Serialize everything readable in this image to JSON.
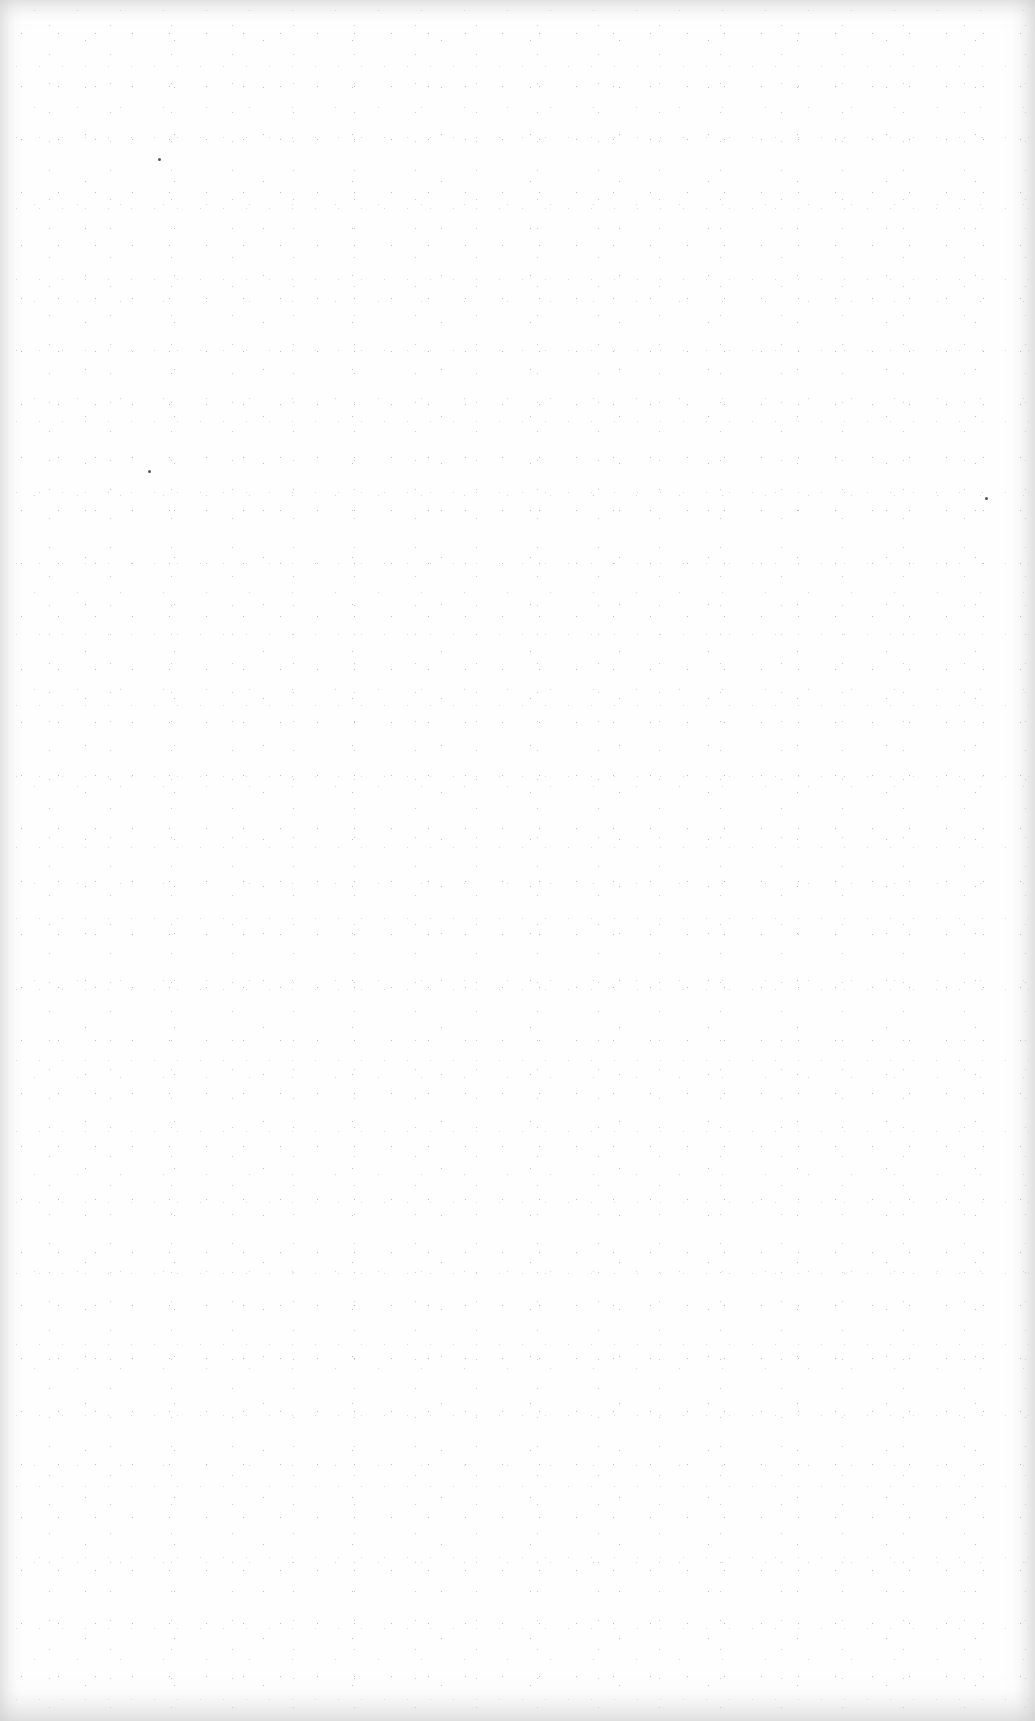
{
  "page": {
    "type": "blank-scanned-page",
    "background_color": "#fefefe",
    "edge_shade_color": "#d0d0d0",
    "text": ""
  }
}
